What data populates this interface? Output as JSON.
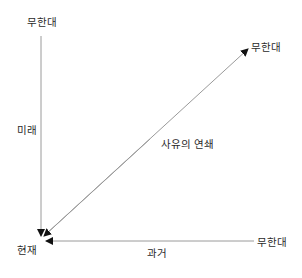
{
  "diagram": {
    "type": "time-axes-diagram",
    "labels": {
      "top_infinity": "무한대",
      "future": "미래",
      "present": "현재",
      "past": "과거",
      "right_infinity": "무한대",
      "diagonal_infinity": "무한대",
      "chain_of_thought": "사유의 연쇄"
    },
    "colors": {
      "line": "#9a9a9a",
      "arrowhead": "#111111",
      "text": "#2a2a2a",
      "background": "#ffffff"
    }
  }
}
